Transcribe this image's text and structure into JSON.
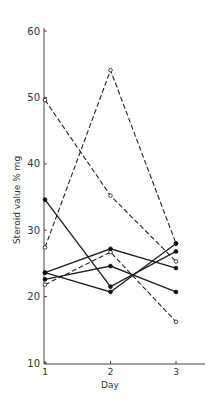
{
  "chart_data": {
    "type": "line",
    "title": "",
    "xlabel": "Day",
    "ylabel": "Steroid value % mg",
    "x": [
      1,
      2,
      3
    ],
    "x_tick_labels": [
      "1",
      "2",
      "3"
    ],
    "y_tick_labels": [
      "10",
      "20",
      "30",
      "40",
      "50",
      "60"
    ],
    "ylim": [
      10,
      62
    ],
    "grid": false,
    "legend": null,
    "series": [
      {
        "name": "Subject A (dashed, open)",
        "style": "dashed",
        "marker": "open",
        "values": [
          27.4,
          54.1,
          28.0
        ]
      },
      {
        "name": "Subject B (dashed, open)",
        "style": "dashed",
        "marker": "open",
        "values": [
          49.6,
          35.2,
          25.3
        ]
      },
      {
        "name": "Subject C (dashed, open)",
        "style": "dashed",
        "marker": "open",
        "values": [
          21.8,
          26.7,
          16.2
        ]
      },
      {
        "name": "Subject D (solid, filled)",
        "style": "solid",
        "marker": "filled",
        "values": [
          34.6,
          21.5,
          26.8
        ]
      },
      {
        "name": "Subject E (solid, filled)",
        "style": "solid",
        "marker": "filled",
        "values": [
          23.6,
          27.2,
          24.3
        ]
      },
      {
        "name": "Subject F (solid, filled)",
        "style": "solid",
        "marker": "filled",
        "values": [
          23.6,
          20.7,
          28.0
        ]
      },
      {
        "name": "Subject G (solid, filled)",
        "style": "solid",
        "marker": "filled",
        "values": [
          22.6,
          24.6,
          20.7
        ]
      }
    ]
  }
}
